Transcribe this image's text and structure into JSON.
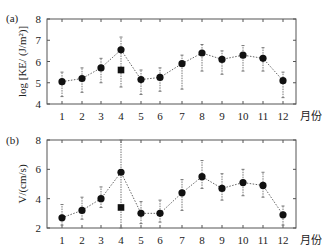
{
  "chart_data": [
    {
      "type": "line",
      "panel_label": "(a)",
      "title": "",
      "xlabel": "月份",
      "ylabel": "log [KE/ (J/m²)]",
      "ylim": [
        4,
        8
      ],
      "yticks": [
        4,
        5,
        6,
        7,
        8
      ],
      "categories": [
        "1",
        "2",
        "3",
        "4",
        "5",
        "6",
        "7",
        "8",
        "9",
        "10",
        "11",
        "12"
      ],
      "series": [
        {
          "name": "mean (circle)",
          "marker": "circle",
          "values": [
            5.05,
            5.2,
            5.7,
            6.55,
            5.15,
            5.25,
            5.9,
            6.4,
            6.1,
            6.3,
            6.15,
            5.1
          ],
          "err_low": [
            4.35,
            4.55,
            5.0,
            4.8,
            4.45,
            4.6,
            4.7,
            5.55,
            5.4,
            5.55,
            5.55,
            4.3
          ],
          "err_high": [
            5.5,
            5.7,
            6.15,
            7.15,
            5.6,
            5.7,
            6.3,
            6.8,
            6.5,
            6.75,
            6.65,
            5.5
          ]
        },
        {
          "name": "square",
          "marker": "square",
          "x": "4",
          "value": 5.6
        }
      ],
      "grid": false
    },
    {
      "type": "line",
      "panel_label": "(b)",
      "title": "",
      "xlabel": "月份",
      "ylabel": "V/(cm/s)",
      "ylim": [
        2,
        8
      ],
      "yticks": [
        2,
        4,
        6,
        8
      ],
      "categories": [
        "1",
        "2",
        "3",
        "4",
        "5",
        "6",
        "7",
        "8",
        "9",
        "10",
        "11",
        "12"
      ],
      "series": [
        {
          "name": "mean (circle)",
          "marker": "circle",
          "values": [
            2.7,
            3.2,
            4.0,
            5.8,
            3.0,
            3.0,
            4.4,
            5.5,
            4.7,
            5.1,
            4.9,
            2.9
          ],
          "err_low": [
            2.2,
            2.6,
            3.4,
            2.0,
            2.3,
            2.4,
            3.2,
            4.7,
            3.9,
            4.2,
            4.1,
            2.2
          ],
          "err_high": [
            3.6,
            4.1,
            4.8,
            8.0,
            3.8,
            3.9,
            5.3,
            6.6,
            5.7,
            6.0,
            5.8,
            3.5
          ]
        },
        {
          "name": "square",
          "marker": "square",
          "x": "4",
          "value": 3.4
        }
      ],
      "grid": false
    }
  ]
}
